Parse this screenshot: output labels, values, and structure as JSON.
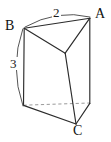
{
  "figure": {
    "shape": "triangular-prism",
    "background_color": "#ffffff",
    "solid_edge_color": "#2b2b2b",
    "hidden_edge_color": "#9a9a9a",
    "dimension_arc_color": "#555555",
    "label_color": "#111111",
    "vertex_labels": {
      "a": "A",
      "b": "B",
      "c": "C"
    },
    "dimension_labels": {
      "top_edge": "2",
      "vertical_edge": "3"
    },
    "geometry": {
      "top_back_left": [
        24,
        28
      ],
      "top_back_right": [
        90,
        18
      ],
      "top_front": [
        65,
        53
      ],
      "bottom_back_left": [
        23,
        105
      ],
      "bottom_back_right": [
        90,
        103
      ],
      "bottom_front": [
        76,
        124
      ]
    },
    "edges": {
      "visible": [
        "top_back_left-top_back_right",
        "top_back_left-top_front",
        "top_front-top_back_right",
        "top_back_left-bottom_back_left",
        "top_back_right-bottom_back_right",
        "top_front-bottom_front",
        "bottom_back_left-bottom_front",
        "bottom_front-bottom_back_right"
      ],
      "hidden": [
        "bottom_back_left-bottom_back_right"
      ]
    }
  }
}
